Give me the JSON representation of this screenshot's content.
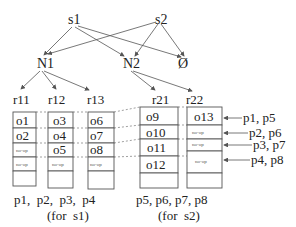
{
  "diagram": {
    "top_nodes": [
      {
        "id": "s1",
        "label": "s1",
        "x": 75,
        "y": 24
      },
      {
        "id": "s2",
        "label": "s2",
        "x": 166,
        "y": 24
      }
    ],
    "mid_nodes": [
      {
        "id": "N1",
        "label": "N1",
        "x": 40,
        "y": 68
      },
      {
        "id": "N2",
        "label": "N2",
        "x": 130,
        "y": 68
      },
      {
        "id": "empty",
        "label": "Ø",
        "x": 185,
        "y": 68
      }
    ],
    "edges": [
      [
        "s1",
        "N1"
      ],
      [
        "s1",
        "N2"
      ],
      [
        "s1",
        "empty"
      ],
      [
        "s2",
        "N1"
      ],
      [
        "s2",
        "N2"
      ],
      [
        "s2",
        "empty"
      ],
      [
        "N1",
        "r11"
      ],
      [
        "N1",
        "r12"
      ],
      [
        "N1",
        "r13"
      ],
      [
        "N2",
        "r21"
      ],
      [
        "N2",
        "r22"
      ]
    ],
    "regions": [
      {
        "id": "r11",
        "label": "r11",
        "cells": [
          "o1",
          "o2",
          "no-op",
          "no-op",
          ""
        ]
      },
      {
        "id": "r12",
        "label": "r12",
        "cells": [
          "o3",
          "o4",
          "o5",
          "no-op",
          ""
        ]
      },
      {
        "id": "r13",
        "label": "r13",
        "cells": [
          "o6",
          "o7",
          "o8",
          "no-op",
          ""
        ]
      },
      {
        "id": "r21",
        "label": "r21",
        "cells": [
          "o9",
          "o10",
          "o11",
          "o12",
          ""
        ]
      },
      {
        "id": "r22",
        "label": "r22",
        "cells": [
          "o13",
          "no-op",
          "no-op",
          "no-op",
          ""
        ]
      }
    ],
    "row_labels": [
      "p1, p5",
      "p2, p6",
      "p3, p7",
      "p4, p8"
    ],
    "captions": {
      "s1_procs": "p1,  p2,  p3,  p4",
      "s1_note": "(for  s1)",
      "s2_procs": "p5, p6, p7, p8",
      "s2_note": "(for  s2)"
    }
  }
}
